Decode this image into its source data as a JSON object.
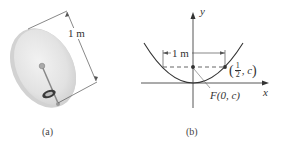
{
  "figure": {
    "panel_a": {
      "caption": "(a)",
      "dimension_label": "1 m",
      "object": "satellite-dish"
    },
    "panel_b": {
      "caption": "(b)",
      "axis_x_label": "x",
      "axis_y_label": "y",
      "dimension_label": "1 m",
      "focus_label": "F(0, c)",
      "point_label_num": "1",
      "point_label_den": "2",
      "point_label_rest": ", c",
      "curve": "parabola"
    },
    "colors": {
      "ink": "#333333",
      "dish_fill": "#e6e6e6",
      "dish_rim": "#c8c8c8"
    }
  }
}
